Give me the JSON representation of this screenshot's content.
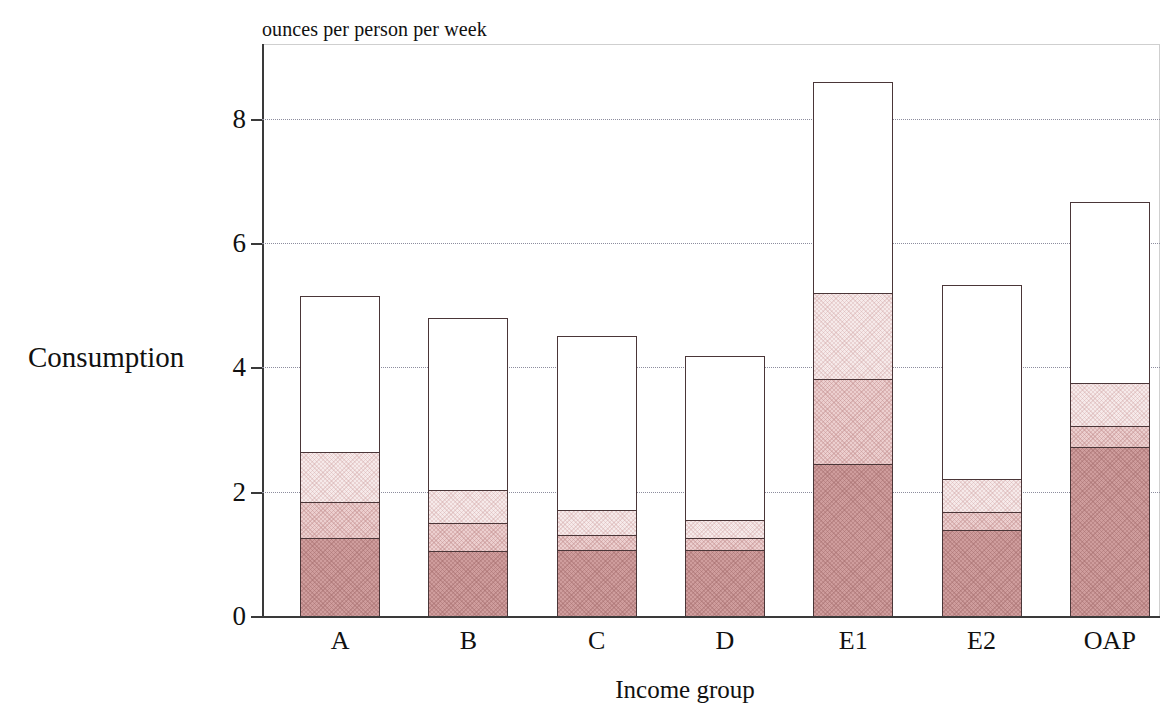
{
  "chart_data": {
    "type": "bar",
    "subtype": "stacked-bar",
    "title": "",
    "unit_caption": "ounces per person per week",
    "ylabel": "Consumption",
    "xlabel": "Income group",
    "categories": [
      "A",
      "B",
      "C",
      "D",
      "E1",
      "E2",
      "OAP"
    ],
    "ylim": [
      0,
      9.2
    ],
    "yticks": [
      0,
      2,
      4,
      6,
      8
    ],
    "ytick_labels": [
      "0",
      "2",
      "4",
      "6",
      "8"
    ],
    "grid": "horizontal-dotted",
    "legend": "none",
    "series": [
      {
        "name": "segment-1-dark",
        "values": [
          1.26,
          1.04,
          1.06,
          1.06,
          2.45,
          1.39,
          2.72
        ]
      },
      {
        "name": "segment-2-mid",
        "values": [
          0.58,
          0.45,
          0.25,
          0.19,
          1.37,
          0.29,
          0.34
        ]
      },
      {
        "name": "segment-3-light",
        "values": [
          0.8,
          0.53,
          0.39,
          0.3,
          1.38,
          0.53,
          0.68
        ]
      },
      {
        "name": "segment-4-white",
        "values": [
          2.5,
          2.78,
          2.81,
          2.64,
          3.39,
          3.12,
          2.92
        ]
      }
    ],
    "totals": [
      5.14,
      4.8,
      4.51,
      4.19,
      8.59,
      5.33,
      6.66
    ],
    "cumulative_boundaries": [
      {
        "category": "A",
        "boundaries": [
          1.26,
          1.84,
          2.64,
          5.14
        ]
      },
      {
        "category": "B",
        "boundaries": [
          1.04,
          1.49,
          2.02,
          4.8
        ]
      },
      {
        "category": "C",
        "boundaries": [
          1.06,
          1.31,
          1.7,
          4.51
        ]
      },
      {
        "category": "D",
        "boundaries": [
          1.06,
          1.25,
          1.55,
          4.19
        ]
      },
      {
        "category": "E1",
        "boundaries": [
          2.45,
          3.82,
          5.2,
          8.59
        ]
      },
      {
        "category": "E2",
        "boundaries": [
          1.39,
          1.68,
          2.21,
          5.33
        ]
      },
      {
        "category": "OAP",
        "boundaries": [
          2.72,
          3.06,
          3.74,
          6.66
        ]
      }
    ],
    "colors": {
      "segment_dark": "#cf9d9d",
      "segment_mid": "#eccfcf",
      "segment_light": "#f6eaea",
      "segment_white": "#ffffff",
      "outline": "#4a3638",
      "gridline": "#8d8d9e",
      "axis": "#3a3a3a"
    }
  }
}
